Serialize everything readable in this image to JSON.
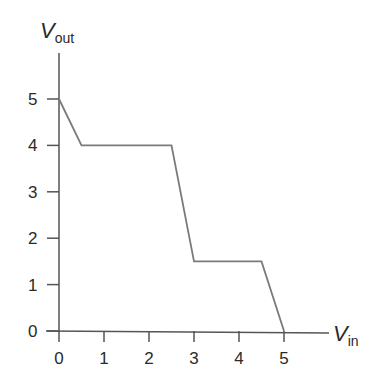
{
  "chart_data": {
    "type": "line",
    "title": "",
    "xlabel": "V_in",
    "ylabel": "V_out",
    "xlabel_main": "V",
    "xlabel_sub": "in",
    "ylabel_main": "V",
    "ylabel_sub": "out",
    "x_ticks": [
      "0",
      "1",
      "2",
      "3",
      "4",
      "5"
    ],
    "y_ticks": [
      "0",
      "1",
      "2",
      "3",
      "4",
      "5"
    ],
    "xlim": [
      0,
      6
    ],
    "ylim": [
      0,
      6
    ],
    "grid": false,
    "series": [
      {
        "name": "transfer characteristic",
        "x": [
          0,
          0.5,
          2.5,
          3,
          4.5,
          5
        ],
        "y": [
          5,
          4,
          4,
          1.5,
          1.5,
          0
        ],
        "color": "#7a7a7a"
      }
    ]
  }
}
